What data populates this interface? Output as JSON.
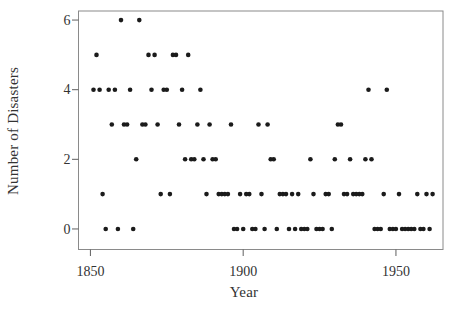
{
  "figure": {
    "background": "#ffffff",
    "marker_color": "#1b1b1b",
    "frame_color": "#8a8a8a",
    "tick_color": "#5f5f5f",
    "text_color": "#333333"
  },
  "chart_data": {
    "type": "scatter",
    "title": "",
    "xlabel": "Year",
    "ylabel": "Number of Disasters",
    "x_ticks": [
      1850,
      1900,
      1950
    ],
    "y_ticks": [
      0,
      2,
      4,
      6
    ],
    "xlim": [
      1846.1,
      1965.4
    ],
    "ylim": [
      -0.59,
      6.26
    ],
    "grid": false,
    "legend": false,
    "marker": "filled-circle",
    "years": [
      1851,
      1852,
      1853,
      1854,
      1855,
      1856,
      1857,
      1858,
      1859,
      1860,
      1861,
      1862,
      1863,
      1864,
      1865,
      1866,
      1867,
      1868,
      1869,
      1870,
      1871,
      1872,
      1873,
      1874,
      1875,
      1876,
      1877,
      1878,
      1879,
      1880,
      1881,
      1882,
      1883,
      1884,
      1885,
      1886,
      1887,
      1888,
      1889,
      1890,
      1891,
      1892,
      1893,
      1894,
      1895,
      1896,
      1897,
      1898,
      1899,
      1900,
      1901,
      1902,
      1903,
      1904,
      1905,
      1906,
      1907,
      1908,
      1909,
      1910,
      1911,
      1912,
      1913,
      1914,
      1915,
      1916,
      1917,
      1918,
      1919,
      1920,
      1921,
      1922,
      1923,
      1924,
      1925,
      1926,
      1927,
      1928,
      1929,
      1930,
      1931,
      1932,
      1933,
      1934,
      1935,
      1936,
      1937,
      1938,
      1939,
      1940,
      1941,
      1942,
      1943,
      1944,
      1945,
      1946,
      1947,
      1948,
      1949,
      1950,
      1951,
      1952,
      1953,
      1954,
      1955,
      1956,
      1957,
      1958,
      1959,
      1960,
      1961,
      1962
    ],
    "counts": [
      4,
      5,
      4,
      1,
      0,
      4,
      3,
      4,
      0,
      6,
      3,
      3,
      4,
      0,
      2,
      6,
      3,
      3,
      5,
      4,
      5,
      3,
      1,
      4,
      4,
      1,
      5,
      5,
      3,
      4,
      2,
      5,
      2,
      2,
      3,
      4,
      2,
      1,
      3,
      2,
      2,
      1,
      1,
      1,
      1,
      3,
      0,
      0,
      1,
      0,
      1,
      1,
      0,
      0,
      3,
      1,
      0,
      3,
      2,
      2,
      0,
      1,
      1,
      1,
      0,
      1,
      0,
      1,
      0,
      0,
      0,
      2,
      1,
      0,
      0,
      0,
      1,
      1,
      0,
      2,
      3,
      3,
      1,
      1,
      2,
      1,
      1,
      1,
      1,
      2,
      4,
      2,
      0,
      0,
      0,
      1,
      4,
      0,
      0,
      0,
      1,
      0,
      0,
      0,
      0,
      0,
      1,
      0,
      0,
      1,
      0,
      1
    ]
  }
}
